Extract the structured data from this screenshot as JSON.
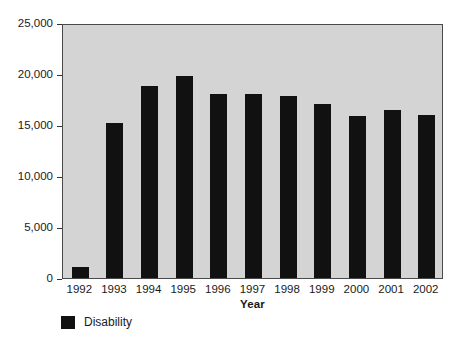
{
  "chart_data": {
    "type": "bar",
    "title": "",
    "subtitle": "",
    "xlabel": "Year",
    "ylabel": "",
    "categories": [
      "1992",
      "1993",
      "1994",
      "1995",
      "1996",
      "1997",
      "1998",
      "1999",
      "2000",
      "2001",
      "2002"
    ],
    "series": [
      {
        "name": "Disability",
        "color": "#111111",
        "values": [
          1100,
          15200,
          18800,
          19800,
          18000,
          18000,
          17800,
          17100,
          15900,
          16500,
          16000
        ]
      }
    ],
    "ylim": [
      0,
      25000
    ],
    "yticks": [
      0,
      5000,
      10000,
      15000,
      20000,
      25000
    ],
    "ytick_labels": [
      "0",
      "5,000",
      "10,000",
      "15,000",
      "20,000",
      "25,000"
    ],
    "grid": false,
    "legend_position": "bottom-left",
    "plot_background": "#d4d4d4",
    "figure_background": "#ffffff",
    "axis_color": "#4a4a4a"
  },
  "legend": {
    "entries": [
      {
        "label": "Disability",
        "color": "#111111"
      }
    ]
  },
  "axes": {
    "x_title": "Year"
  }
}
